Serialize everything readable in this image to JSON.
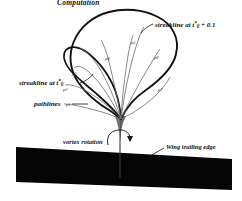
{
  "figure": {
    "title": "Computation",
    "labels": {
      "streakline_outer": {
        "prefix": "streakline at t",
        "star": "*",
        "sub": "0",
        "suffix": " + 0.1"
      },
      "streakline_inner": {
        "prefix": "streakline at t",
        "star": "*",
        "sub": "0"
      },
      "pathlines": "pathlines",
      "vortex_rotation": "vortex rotation",
      "wing_trailing_edge": "Wing trailing edge"
    },
    "pathline_markers": [
      {
        "id": "p1",
        "label": "p1",
        "x": 66,
        "y": 103
      },
      {
        "id": "p2",
        "label": "p2",
        "x": 63,
        "y": 88
      },
      {
        "id": "p3",
        "label": "p3",
        "x": 72,
        "y": 72
      },
      {
        "id": "p4",
        "label": "p4",
        "x": 105,
        "y": 57
      },
      {
        "id": "p5",
        "label": "p5",
        "x": 131,
        "y": 41
      },
      {
        "id": "p6",
        "label": "p6",
        "x": 154,
        "y": 56
      },
      {
        "id": "p7",
        "label": "p7",
        "x": 158,
        "y": 88
      }
    ],
    "colors": {
      "wing_fill": "#050505",
      "streakline_stroke": "#111111",
      "pathline_stroke": "#6b6b6b",
      "text": "#111111",
      "background": "#ffffff"
    }
  }
}
